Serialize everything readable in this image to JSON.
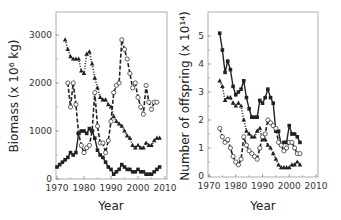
{
  "chart_data": [
    {
      "type": "line",
      "title": "",
      "xlabel": "Year",
      "ylabel": "Biomass (x 10⁶ kg)",
      "xlim": [
        1970,
        2010
      ],
      "ylim": [
        0,
        3450
      ],
      "xticks": [
        1970,
        1980,
        1990,
        2000,
        2010
      ],
      "yticks": [
        0,
        1000,
        2000,
        3000
      ],
      "grid": false,
      "legend": null,
      "series": [
        {
          "name": "triangles",
          "marker": "triangle-filled",
          "line": "dotted",
          "x": [
            1973,
            1974,
            1975,
            1976,
            1977,
            1978,
            1979,
            1980,
            1981,
            1982,
            1983,
            1984,
            1985,
            1986,
            1987,
            1988,
            1989,
            1990,
            1991,
            1992,
            1993,
            1994,
            1995,
            1996,
            1997,
            1998,
            1999,
            2000,
            2001,
            2002,
            2003,
            2004,
            2005,
            2006,
            2007,
            2008
          ],
          "values": [
            2900,
            2700,
            2550,
            2500,
            2500,
            2500,
            2250,
            2200,
            2600,
            2650,
            2400,
            2100,
            1900,
            1700,
            1650,
            1650,
            1550,
            1500,
            1300,
            1200,
            1150,
            1100,
            1000,
            900,
            850,
            700,
            650,
            700,
            650,
            650,
            750,
            700,
            700,
            800,
            850,
            850
          ]
        },
        {
          "name": "circles",
          "marker": "circle-open",
          "line": "dashed",
          "x": [
            1974,
            1975,
            1976,
            1977,
            1978,
            1979,
            1980,
            1981,
            1982,
            1983,
            1984,
            1985,
            1986,
            1987,
            1988,
            1989,
            1990,
            1991,
            1992,
            1993,
            1994,
            1995,
            1996,
            1997,
            1998,
            1999,
            2000,
            2001,
            2002,
            2003,
            2004,
            2005,
            2006,
            2007
          ],
          "values": [
            2000,
            1500,
            2000,
            1550,
            950,
            700,
            550,
            650,
            700,
            1000,
            1800,
            1100,
            750,
            750,
            550,
            800,
            1200,
            1800,
            1950,
            2000,
            2900,
            2700,
            2500,
            2200,
            1900,
            2000,
            1700,
            1500,
            1350,
            1950,
            1600,
            1450,
            1600,
            1600
          ]
        },
        {
          "name": "squares",
          "marker": "square-filled",
          "line": "solid",
          "x": [
            1970,
            1971,
            1972,
            1973,
            1974,
            1975,
            1976,
            1977,
            1978,
            1979,
            1980,
            1981,
            1982,
            1983,
            1984,
            1985,
            1986,
            1987,
            1988,
            1989,
            1990,
            1991,
            1992,
            1993,
            1994,
            1995,
            1996,
            1997,
            1998,
            1999,
            2000,
            2001,
            2002,
            2003,
            2004,
            2005,
            2006,
            2007,
            2008
          ],
          "values": [
            250,
            300,
            350,
            400,
            450,
            550,
            500,
            550,
            950,
            1000,
            1000,
            950,
            1050,
            1000,
            850,
            600,
            500,
            450,
            350,
            250,
            200,
            100,
            150,
            200,
            300,
            250,
            200,
            200,
            150,
            150,
            200,
            150,
            150,
            100,
            100,
            100,
            150,
            200,
            250
          ]
        }
      ]
    },
    {
      "type": "line",
      "title": "",
      "xlabel": "Year",
      "ylabel": "Number of offspring (x 10¹⁴)",
      "xlim": [
        1970,
        2010
      ],
      "ylim": [
        0,
        5.7
      ],
      "xticks": [
        1970,
        1980,
        1990,
        2000,
        2010
      ],
      "yticks": [
        0,
        1,
        2,
        3,
        4,
        5
      ],
      "grid": false,
      "legend": null,
      "series": [
        {
          "name": "squares",
          "marker": "square-filled",
          "line": "solid",
          "x": [
            1974,
            1975,
            1976,
            1977,
            1978,
            1979,
            1980,
            1981,
            1982,
            1983,
            1984,
            1985,
            1986,
            1987,
            1988,
            1989,
            1990,
            1991,
            1992,
            1993,
            1994,
            1995,
            1996,
            1997,
            1998,
            1999,
            2000,
            2001,
            2002,
            2003,
            2004
          ],
          "values": [
            5.1,
            4.5,
            3.7,
            4.1,
            3.8,
            3.2,
            2.9,
            3.0,
            3.1,
            3.4,
            2.8,
            2.4,
            2.1,
            2.1,
            2.1,
            2.7,
            2.6,
            2.8,
            3.1,
            2.8,
            2.6,
            1.6,
            1.6,
            1.1,
            1.2,
            1.2,
            1.8,
            1.5,
            1.5,
            1.4,
            1.2
          ]
        },
        {
          "name": "triangles",
          "marker": "triangle-filled",
          "line": "dotted",
          "x": [
            1974,
            1975,
            1976,
            1977,
            1978,
            1979,
            1980,
            1981,
            1982,
            1983,
            1984,
            1985,
            1986,
            1987,
            1988,
            1989,
            1990,
            1991,
            1992,
            1993,
            1994,
            1995,
            1996,
            1997,
            1998,
            1999,
            2000,
            2001,
            2002,
            2003,
            2004
          ],
          "values": [
            3.4,
            3.2,
            2.7,
            2.8,
            2.8,
            2.6,
            2.5,
            2.6,
            2.5,
            2.0,
            1.6,
            1.5,
            1.4,
            1.4,
            1.6,
            1.7,
            1.3,
            1.3,
            1.1,
            1.0,
            0.8,
            0.6,
            0.4,
            0.3,
            0.3,
            0.3,
            0.3,
            0.4,
            0.4,
            0.5,
            0.4
          ]
        },
        {
          "name": "circles",
          "marker": "circle-open",
          "line": "dashed",
          "x": [
            1974,
            1975,
            1976,
            1977,
            1978,
            1979,
            1980,
            1981,
            1982,
            1983,
            1984,
            1985,
            1986,
            1987,
            1988,
            1989,
            1990,
            1991,
            1992,
            1993,
            1994,
            1995,
            1996,
            1997,
            1998,
            1999,
            2000,
            2001,
            2002,
            2003,
            2004
          ],
          "values": [
            1.7,
            1.4,
            1.2,
            1.3,
            1.0,
            0.7,
            0.5,
            0.4,
            0.6,
            1.4,
            1.1,
            0.9,
            0.8,
            0.7,
            0.6,
            1.0,
            1.4,
            1.5,
            2.0,
            1.9,
            1.8,
            1.7,
            1.2,
            1.1,
            0.9,
            1.0,
            1.2,
            1.2,
            1.0,
            0.8,
            0.8
          ]
        }
      ]
    }
  ],
  "panels": [
    {
      "xlabel": "Year",
      "ylabel": "Biomass (x 10⁶ kg)",
      "xtick_labels": [
        "1970",
        "1980",
        "1990",
        "2000",
        "2010"
      ],
      "ytick_labels": [
        "0",
        "1000",
        "2000",
        "3000"
      ]
    },
    {
      "xlabel": "Year",
      "ylabel": "Number of offspring (x 10¹⁴)",
      "xtick_labels": [
        "1970",
        "1980",
        "1990",
        "2000",
        "2010"
      ],
      "ytick_labels": [
        "0",
        "1",
        "2",
        "3",
        "4",
        "5"
      ]
    }
  ],
  "colors": {
    "ink": "#222222",
    "frame": "#888888",
    "background": "#ffffff"
  }
}
